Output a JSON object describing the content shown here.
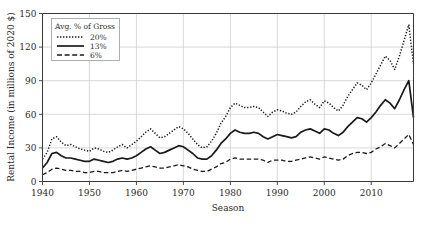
{
  "chart_data": {
    "type": "line",
    "title": "",
    "xlabel": "Season",
    "ylabel": "Rental Income (in millions of 2020 $)",
    "xlim": [
      1940,
      2019
    ],
    "ylim": [
      0,
      150
    ],
    "xticks": [
      1940,
      1950,
      1960,
      1970,
      1980,
      1990,
      2000,
      2010
    ],
    "yticks": [
      0,
      30,
      60,
      90,
      120,
      150
    ],
    "grid": true,
    "legend_title": "Avg. % of Gross",
    "legend_position": "top-left",
    "x": [
      1940,
      1941,
      1942,
      1943,
      1944,
      1945,
      1946,
      1947,
      1948,
      1949,
      1950,
      1951,
      1952,
      1953,
      1954,
      1955,
      1956,
      1957,
      1958,
      1959,
      1960,
      1961,
      1962,
      1963,
      1964,
      1965,
      1966,
      1967,
      1968,
      1969,
      1970,
      1971,
      1972,
      1973,
      1974,
      1975,
      1976,
      1977,
      1978,
      1979,
      1980,
      1981,
      1982,
      1983,
      1984,
      1985,
      1986,
      1987,
      1988,
      1989,
      1990,
      1991,
      1992,
      1993,
      1994,
      1995,
      1996,
      1997,
      1998,
      1999,
      2000,
      2001,
      2002,
      2003,
      2004,
      2005,
      2006,
      2007,
      2008,
      2009,
      2010,
      2011,
      2012,
      2013,
      2014,
      2015,
      2016,
      2017,
      2018,
      2019
    ],
    "series": [
      {
        "name": "20%",
        "label": "20%",
        "style": "dotted",
        "color": "#1a1a1a",
        "values": [
          20,
          26,
          38,
          40,
          35,
          32,
          33,
          31,
          29,
          28,
          27,
          30,
          29,
          27,
          26,
          28,
          31,
          33,
          30,
          33,
          36,
          40,
          44,
          47,
          43,
          39,
          40,
          43,
          46,
          49,
          47,
          43,
          38,
          33,
          30,
          31,
          36,
          43,
          52,
          58,
          66,
          70,
          68,
          66,
          66,
          67,
          66,
          62,
          58,
          62,
          64,
          63,
          61,
          60,
          62,
          67,
          71,
          73,
          69,
          66,
          72,
          70,
          66,
          63,
          68,
          76,
          82,
          88,
          86,
          82,
          88,
          96,
          104,
          112,
          108,
          100,
          112,
          126,
          140,
          105
        ]
      },
      {
        "name": "13%",
        "label": "13%",
        "style": "solid",
        "color": "#1a1a1a",
        "values": [
          12,
          17,
          25,
          26,
          23,
          21,
          21,
          20,
          19,
          18,
          18,
          20,
          19,
          18,
          17,
          18,
          20,
          21,
          20,
          21,
          23,
          26,
          29,
          31,
          28,
          25,
          26,
          28,
          30,
          32,
          31,
          28,
          25,
          21,
          20,
          20,
          23,
          28,
          34,
          38,
          43,
          46,
          44,
          43,
          43,
          44,
          43,
          40,
          38,
          40,
          42,
          41,
          40,
          39,
          40,
          44,
          46,
          47,
          45,
          43,
          47,
          46,
          43,
          41,
          44,
          49,
          53,
          57,
          56,
          53,
          57,
          62,
          68,
          73,
          70,
          65,
          73,
          82,
          90,
          57
        ]
      },
      {
        "name": "6%",
        "label": "6%",
        "style": "dashed",
        "color": "#1a1a1a",
        "values": [
          6,
          8,
          11,
          12,
          11,
          10,
          10,
          9,
          9,
          8,
          8,
          9,
          9,
          8,
          8,
          8,
          9,
          10,
          9,
          10,
          11,
          12,
          13,
          14,
          13,
          12,
          12,
          13,
          14,
          15,
          14,
          13,
          11,
          10,
          9,
          9,
          11,
          13,
          16,
          17,
          20,
          21,
          20,
          20,
          20,
          20,
          20,
          19,
          17,
          19,
          19,
          19,
          18,
          18,
          19,
          20,
          21,
          22,
          21,
          20,
          22,
          21,
          20,
          19,
          20,
          23,
          25,
          26,
          26,
          25,
          26,
          29,
          31,
          34,
          32,
          30,
          34,
          38,
          42,
          33
        ]
      }
    ]
  },
  "axis": {
    "y_title": "Rental Income (in millions of 2020 $)",
    "x_title": "Season",
    "y_tick_labels": [
      "0",
      "30",
      "60",
      "90",
      "120",
      "150"
    ],
    "x_tick_labels": [
      "1940",
      "1950",
      "1960",
      "1970",
      "1980",
      "1990",
      "2000",
      "2010"
    ]
  },
  "legend": {
    "title": "Avg. % of Gross",
    "entries": [
      {
        "label": "20%",
        "style": "dotted"
      },
      {
        "label": "13%",
        "style": "solid"
      },
      {
        "label": "6%",
        "style": "dashed"
      }
    ]
  }
}
